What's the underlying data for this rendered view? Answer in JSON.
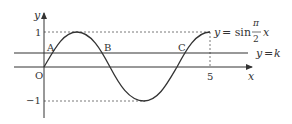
{
  "diagram": {
    "axes": {
      "x_label": "x",
      "y_label": "y",
      "origin_label": "O",
      "x_ticks": [
        {
          "value": 5,
          "label": "5"
        }
      ],
      "y_ticks": [
        {
          "value": 1,
          "label": "1"
        },
        {
          "value": -1,
          "label": "−1"
        }
      ]
    },
    "curve": {
      "equation_prefix": "y = sin",
      "fraction_num": "π",
      "fraction_den": "2",
      "variable": "x",
      "domain": [
        0,
        5
      ]
    },
    "line": {
      "label": "y = k"
    },
    "points": [
      {
        "name": "A",
        "label": "A"
      },
      {
        "name": "B",
        "label": "B"
      },
      {
        "name": "C",
        "label": "C"
      }
    ],
    "colors": {
      "stroke": "#333333",
      "dashed": "#555555"
    }
  }
}
